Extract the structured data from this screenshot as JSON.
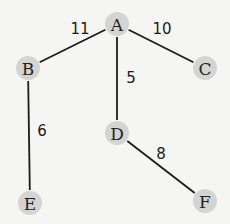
{
  "diagram": {
    "type": "weighted-tree",
    "nodes": [
      {
        "id": "A",
        "label": "A",
        "x": 117,
        "y": 24
      },
      {
        "id": "B",
        "label": "B",
        "x": 28,
        "y": 68
      },
      {
        "id": "C",
        "label": "C",
        "x": 205,
        "y": 68
      },
      {
        "id": "D",
        "label": "D",
        "x": 117,
        "y": 133
      },
      {
        "id": "E",
        "label": "E",
        "x": 30,
        "y": 203
      },
      {
        "id": "F",
        "label": "F",
        "x": 205,
        "y": 201
      }
    ],
    "edges": [
      {
        "from": "A",
        "to": "B",
        "weight": "11",
        "label_x": 80,
        "label_y": 29
      },
      {
        "from": "A",
        "to": "C",
        "weight": "10",
        "label_x": 162,
        "label_y": 29
      },
      {
        "from": "A",
        "to": "D",
        "weight": "5",
        "label_x": 131,
        "label_y": 78
      },
      {
        "from": "B",
        "to": "E",
        "weight": "6",
        "label_x": 42,
        "label_y": 131
      },
      {
        "from": "D",
        "to": "F",
        "weight": "8",
        "label_x": 161,
        "label_y": 154
      }
    ],
    "colors": {
      "node_fill": "#d4d4d2",
      "edge": "#1c1c1c",
      "background": "#f5f5f3"
    }
  }
}
